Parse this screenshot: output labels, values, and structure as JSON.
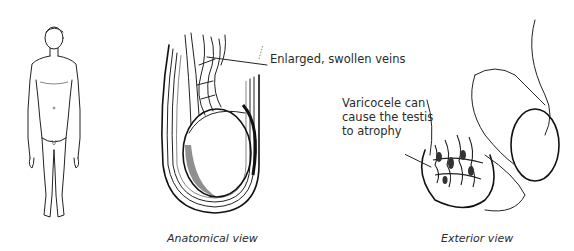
{
  "figure": {
    "panels": [
      {
        "id": "full-body",
        "description": "Front view of standing male figure"
      },
      {
        "id": "anatomical",
        "caption": "Anatomical view"
      },
      {
        "id": "exterior",
        "caption": "Exterior view"
      }
    ],
    "callouts": {
      "veins": "Enlarged, swollen veins",
      "atrophy_line1": "Varicocele can",
      "atrophy_line2": "cause the testis",
      "atrophy_line3": "to atrophy"
    },
    "colors": {
      "background": "#ffffff",
      "ink": "#222222",
      "text": "#2b2b2b"
    }
  }
}
